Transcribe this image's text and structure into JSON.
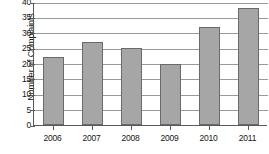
{
  "chart_data": {
    "type": "bar",
    "title": "",
    "xlabel": "",
    "ylabel": "Number of Complaints",
    "categories": [
      "2006",
      "2007",
      "2008",
      "2009",
      "2010",
      "2011"
    ],
    "values": [
      22,
      27,
      25,
      20,
      32,
      38
    ],
    "ylim": [
      0,
      40
    ],
    "ytick_values": [
      0,
      5,
      10,
      15,
      20,
      25,
      30,
      35,
      40
    ],
    "ytick_labels": [
      "0",
      "5",
      "10",
      "15",
      "20",
      "25",
      "30",
      "35",
      "40"
    ],
    "grid": true,
    "grid_axis": "y",
    "legend": false,
    "bar_color": "#a6a6a6",
    "bar_edge_color": "#6a6a6a",
    "axis_color": "#58595b",
    "grid_color": "#9a9a9a",
    "text_color": "#161616"
  }
}
